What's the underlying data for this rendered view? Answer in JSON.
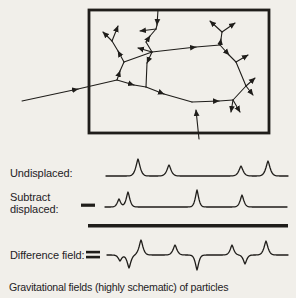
{
  "colors": {
    "background": "#f1efea",
    "ink": "#1f1d1a"
  },
  "caption": "Gravitational fields (highly schematic) of particles",
  "box": {
    "x": 89,
    "y": 10,
    "w": 180,
    "h": 123,
    "stroke_width": 2.8
  },
  "network": {
    "description": "particle-network-with-field-vectors",
    "segments": [
      [
        22,
        101,
        78,
        89,
        1
      ],
      [
        78,
        89,
        117,
        80,
        0
      ],
      [
        117,
        80,
        134,
        85,
        1
      ],
      [
        134,
        85,
        146,
        87,
        0
      ],
      [
        146,
        87,
        164,
        94,
        1
      ],
      [
        164,
        94,
        192,
        102,
        0
      ],
      [
        192,
        102,
        219,
        101,
        1
      ],
      [
        219,
        101,
        233,
        100,
        0
      ],
      [
        199,
        139,
        196,
        110,
        1
      ],
      [
        117,
        80,
        120,
        71,
        1
      ],
      [
        120,
        71,
        124,
        62,
        0
      ],
      [
        124,
        62,
        118,
        51,
        1
      ],
      [
        118,
        51,
        112,
        41,
        0
      ],
      [
        112,
        41,
        103,
        32,
        1
      ],
      [
        112,
        41,
        118,
        26,
        1
      ],
      [
        124,
        62,
        152,
        52,
        0
      ],
      [
        152,
        52,
        147,
        63,
        1
      ],
      [
        147,
        63,
        146,
        87,
        0
      ],
      [
        158,
        10,
        157,
        25,
        1
      ],
      [
        157,
        25,
        156,
        29,
        0
      ],
      [
        146,
        42,
        150,
        36,
        1
      ],
      [
        150,
        36,
        156,
        29,
        0
      ],
      [
        146,
        42,
        152,
        52,
        0
      ],
      [
        156,
        29,
        140,
        31,
        1
      ],
      [
        152,
        52,
        138,
        48,
        1
      ],
      [
        152,
        52,
        196,
        47,
        1
      ],
      [
        196,
        47,
        220,
        45,
        0
      ],
      [
        220,
        45,
        221,
        39,
        1
      ],
      [
        221,
        39,
        222,
        32,
        0
      ],
      [
        222,
        32,
        210,
        21,
        1
      ],
      [
        222,
        32,
        235,
        23,
        1
      ],
      [
        220,
        45,
        229,
        55,
        1
      ],
      [
        229,
        55,
        236,
        62,
        0
      ],
      [
        236,
        62,
        248,
        55,
        1
      ],
      [
        236,
        62,
        246,
        86,
        0
      ],
      [
        246,
        86,
        255,
        78,
        1
      ],
      [
        246,
        86,
        253,
        95,
        1
      ],
      [
        246,
        86,
        233,
        100,
        0
      ],
      [
        233,
        100,
        240,
        112,
        1
      ],
      [
        233,
        100,
        231,
        112,
        1
      ]
    ]
  },
  "waveform_rows": [
    {
      "id": "undisplaced",
      "label": "Undisplaced:",
      "label2": "",
      "operator": "",
      "operator_bars": [],
      "baseline": 176,
      "x0": 106,
      "x1": 288,
      "peaks": [
        [
          138,
          17,
          3
        ],
        [
          169,
          11,
          3
        ],
        [
          241,
          10,
          3
        ],
        [
          268,
          15,
          3
        ]
      ]
    },
    {
      "id": "subtract-displaced",
      "label": "Subtract",
      "label2": "displaced:",
      "operator": "−",
      "operator_bars": [
        [
          81,
          203.6,
          14,
          3.2
        ]
      ],
      "baseline": 207,
      "x0": 105,
      "x1": 287,
      "peaks": [
        [
          119,
          8,
          2.4
        ],
        [
          128,
          15,
          2.6
        ],
        [
          197,
          17,
          2.4
        ],
        [
          242,
          12,
          2.6
        ]
      ]
    },
    {
      "id": "difference-field",
      "label": "Difference field:",
      "label2": "",
      "operator": "=",
      "operator_bars": [
        [
          86,
          250.8,
          14,
          2.6
        ],
        [
          86,
          255.8,
          14,
          2.6
        ]
      ],
      "baseline": 255,
      "x0": 107,
      "x1": 288,
      "peaks": [
        [
          120,
          -6,
          2.4
        ],
        [
          129,
          -13,
          2.6
        ],
        [
          141,
          15,
          2.8
        ],
        [
          175,
          10,
          2.8
        ],
        [
          197,
          -15,
          2.4
        ],
        [
          232,
          10,
          2.6
        ],
        [
          245,
          -9,
          2.4
        ],
        [
          266,
          14,
          2.8
        ]
      ]
    }
  ],
  "separator": {
    "x": 88,
    "y": 224,
    "w": 200,
    "h": 3.5
  }
}
